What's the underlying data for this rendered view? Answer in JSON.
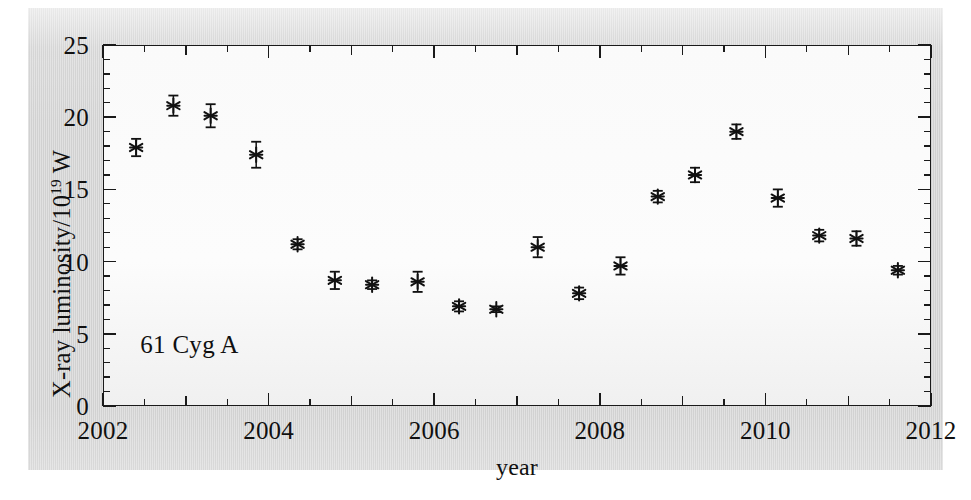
{
  "figure": {
    "background_color": "#d4d4d4",
    "plot_background_color": "#fdfdfd",
    "axis_color": "#1a1a1a",
    "marker_color": "#111111"
  },
  "chart_data": {
    "type": "scatter",
    "title": "",
    "subtitle": "",
    "xlabel": "year",
    "ylabel": "X-ray luminosity/10¹⁹ W",
    "ylabel_parts": {
      "pre": "X-ray luminosity/10",
      "sup": "19",
      "post": " W"
    },
    "annotation": "61 Cyg A",
    "annotations": [
      {
        "text": "61 Cyg A",
        "x": 2002.45,
        "y": 4.2
      }
    ],
    "legend": [],
    "legend_position": "none",
    "grid": false,
    "marker_style": "asterisk-with-errorbars",
    "errorbars": "y",
    "xlim": [
      2002,
      2012
    ],
    "ylim": [
      0,
      25
    ],
    "xticks": [
      2002,
      2004,
      2006,
      2008,
      2010,
      2012
    ],
    "xtick_labels": [
      "2002",
      "2004",
      "2006",
      "2008",
      "2010",
      "2012"
    ],
    "x_minor_tick_step": 0.5,
    "yticks": [
      0,
      5,
      10,
      15,
      20,
      25
    ],
    "ytick_labels": [
      "0",
      "5",
      "10",
      "15",
      "20",
      "25"
    ],
    "y_minor_tick_step": 1,
    "x": [
      2002.4,
      2002.85,
      2003.3,
      2003.85,
      2004.35,
      2004.8,
      2005.25,
      2005.8,
      2006.3,
      2006.75,
      2007.25,
      2007.75,
      2008.25,
      2008.7,
      2009.15,
      2009.65,
      2010.15,
      2010.65,
      2011.1,
      2011.6
    ],
    "y": [
      17.9,
      20.8,
      20.1,
      17.4,
      11.2,
      8.7,
      8.4,
      8.6,
      6.9,
      6.7,
      11.0,
      7.8,
      9.7,
      14.5,
      16.0,
      19.0,
      14.4,
      11.8,
      11.6,
      9.4
    ],
    "yerr": [
      0.6,
      0.7,
      0.8,
      0.9,
      0.35,
      0.6,
      0.3,
      0.7,
      0.35,
      0.2,
      0.7,
      0.4,
      0.6,
      0.4,
      0.5,
      0.5,
      0.6,
      0.4,
      0.5,
      0.3
    ],
    "points": [
      {
        "year": 2002.4,
        "luminosity": 17.9,
        "error": 0.6
      },
      {
        "year": 2002.85,
        "luminosity": 20.8,
        "error": 0.7
      },
      {
        "year": 2003.3,
        "luminosity": 20.1,
        "error": 0.8
      },
      {
        "year": 2003.85,
        "luminosity": 17.4,
        "error": 0.9
      },
      {
        "year": 2004.35,
        "luminosity": 11.2,
        "error": 0.35
      },
      {
        "year": 2004.8,
        "luminosity": 8.7,
        "error": 0.6
      },
      {
        "year": 2005.25,
        "luminosity": 8.4,
        "error": 0.3
      },
      {
        "year": 2005.8,
        "luminosity": 8.6,
        "error": 0.7
      },
      {
        "year": 2006.3,
        "luminosity": 6.9,
        "error": 0.35
      },
      {
        "year": 2006.75,
        "luminosity": 6.7,
        "error": 0.2
      },
      {
        "year": 2007.25,
        "luminosity": 11.0,
        "error": 0.7
      },
      {
        "year": 2007.75,
        "luminosity": 7.8,
        "error": 0.4
      },
      {
        "year": 2008.25,
        "luminosity": 9.7,
        "error": 0.6
      },
      {
        "year": 2008.7,
        "luminosity": 14.5,
        "error": 0.4
      },
      {
        "year": 2009.15,
        "luminosity": 16.0,
        "error": 0.5
      },
      {
        "year": 2009.65,
        "luminosity": 19.0,
        "error": 0.5
      },
      {
        "year": 2010.15,
        "luminosity": 14.4,
        "error": 0.6
      },
      {
        "year": 2010.65,
        "luminosity": 11.8,
        "error": 0.4
      },
      {
        "year": 2011.1,
        "luminosity": 11.6,
        "error": 0.5
      },
      {
        "year": 2011.6,
        "luminosity": 9.4,
        "error": 0.3
      }
    ]
  }
}
